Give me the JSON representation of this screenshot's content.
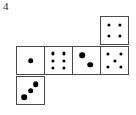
{
  "figure": {
    "label": "4",
    "type": "cube-net"
  },
  "geometry": {
    "cell_size": 29,
    "origin_x": 16,
    "row_top_y": 46,
    "top_square_y": 15,
    "bottom_square_y": 76,
    "top_square_x": 100
  },
  "faces": [
    {
      "name": "face-top-above-fourth",
      "value": 4,
      "col": 3,
      "row": -1,
      "pip_style": "small",
      "pips": [
        {
          "x": 30,
          "y": 30
        },
        {
          "x": 70,
          "y": 30
        },
        {
          "x": 30,
          "y": 70
        },
        {
          "x": 70,
          "y": 70
        }
      ]
    },
    {
      "name": "face-row-first",
      "value": 1,
      "col": 0,
      "row": 0,
      "pip_style": "large",
      "pips": [
        {
          "x": 50,
          "y": 50
        }
      ]
    },
    {
      "name": "face-row-second",
      "value": 6,
      "col": 1,
      "row": 0,
      "pip_style": "small",
      "pips": [
        {
          "x": 30,
          "y": 24
        },
        {
          "x": 70,
          "y": 24
        },
        {
          "x": 30,
          "y": 50
        },
        {
          "x": 70,
          "y": 50
        },
        {
          "x": 30,
          "y": 76
        },
        {
          "x": 70,
          "y": 76
        }
      ]
    },
    {
      "name": "face-row-third",
      "value": 2,
      "col": 2,
      "row": 0,
      "pip_style": "large",
      "pips": [
        {
          "x": 33,
          "y": 30
        },
        {
          "x": 64,
          "y": 66
        }
      ]
    },
    {
      "name": "face-row-fourth",
      "value": 5,
      "col": 3,
      "row": 0,
      "pip_style": "small",
      "pips": [
        {
          "x": 27,
          "y": 26
        },
        {
          "x": 73,
          "y": 26
        },
        {
          "x": 50,
          "y": 50
        },
        {
          "x": 27,
          "y": 74
        },
        {
          "x": 73,
          "y": 74
        }
      ]
    },
    {
      "name": "face-bottom-below-first",
      "value": 3,
      "col": 0,
      "row": 1,
      "pip_style": "large",
      "pips": [
        {
          "x": 70,
          "y": 26
        },
        {
          "x": 50,
          "y": 50
        },
        {
          "x": 26,
          "y": 74
        }
      ]
    }
  ],
  "style": {
    "border_color": "#4a4a4a",
    "pip_color": "#000000",
    "background": "#ffffff",
    "label_color": "#2b2b2b",
    "pip_small_px": 3.2,
    "pip_large_px": 5.6
  }
}
